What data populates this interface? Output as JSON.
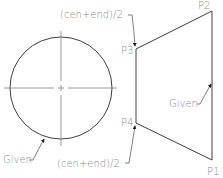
{
  "diagram": {
    "colors": {
      "stroke": "#404040",
      "centerline": "#808080",
      "text": "#8a8a8a",
      "background": "#ffffff"
    },
    "circle": {
      "label": "Given",
      "cx": 61,
      "cy": 88,
      "r": 51
    },
    "quad": {
      "points": {
        "P1": {
          "label": "P1",
          "x": 212,
          "y": 160
        },
        "P2": {
          "label": "P2",
          "x": 212,
          "y": 11
        },
        "P3": {
          "label": "P3",
          "x": 136,
          "y": 49
        },
        "P4": {
          "label": "P4",
          "x": 136,
          "y": 123
        }
      },
      "right_edge_label": "Given"
    },
    "annotations": {
      "top_midpoint": "(cen+end)/2",
      "bottom_midpoint": "(cen+end)/2",
      "circle_given": "Given",
      "edge_given": "Given"
    }
  }
}
